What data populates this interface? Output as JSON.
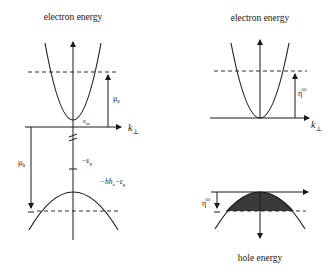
{
  "left_panel": {
    "title": "electron energy",
    "axis_label": "k",
    "axis_sub": "⊥",
    "mu_e": "μ",
    "mu_e_sub": "e",
    "eps_min": "ε",
    "eps_min_sub": "m",
    "mu_h": "μ",
    "mu_h_sub": "h",
    "minus_eps_g": "−ε",
    "minus_eps_g_sub": "g",
    "hole_band_label": "−hh",
    "hole_band_label_sub1": "e",
    "hole_band_label_tail": "−ε",
    "hole_band_label_sub2": "g"
  },
  "right_panel": {
    "title": "electron energy",
    "axis_label": "k",
    "axis_sub": "⊥",
    "eta_e": "η",
    "eta_e_sub": "m",
    "eta_e_sup": "(0)",
    "eta_h": "η",
    "eta_h_sub": "h",
    "eta_h_sup": "(0)",
    "bottom_title": "hole energy"
  },
  "colors": {
    "line": "#1a1a1a",
    "shade": "#3a3a3a",
    "background": "#ffffff"
  }
}
